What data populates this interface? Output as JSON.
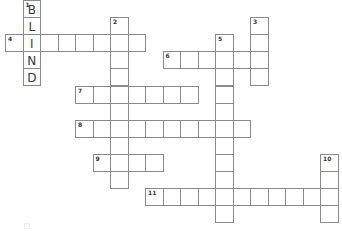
{
  "grid": {
    "cell_width": 17.5,
    "cell_height": 17.1,
    "origin_x": 5,
    "origin_y": 0,
    "colors": {
      "border": "#8a8a8a",
      "letter": "#3a3a3a",
      "number": "#333333",
      "background": "#ffffff"
    }
  },
  "entries": [
    {
      "number": "1",
      "direction": "down",
      "col": 1,
      "row": 0,
      "length": 5,
      "letters": "BLIND"
    },
    {
      "number": "2",
      "direction": "down",
      "col": 6,
      "row": 1,
      "length": 10,
      "letters": ""
    },
    {
      "number": "3",
      "direction": "down",
      "col": 14,
      "row": 1,
      "length": 4,
      "letters": ""
    },
    {
      "number": "4",
      "direction": "across",
      "col": 0,
      "row": 2,
      "length": 8,
      "letters": ""
    },
    {
      "number": "5",
      "direction": "down",
      "col": 12,
      "row": 2,
      "length": 11,
      "letters": ""
    },
    {
      "number": "6",
      "direction": "across",
      "col": 9,
      "row": 3,
      "length": 6,
      "letters": ""
    },
    {
      "number": "7",
      "direction": "across",
      "col": 4,
      "row": 5,
      "length": 7,
      "letters": ""
    },
    {
      "number": "8",
      "direction": "across",
      "col": 4,
      "row": 7,
      "length": 10,
      "letters": ""
    },
    {
      "number": "9",
      "direction": "across",
      "col": 5,
      "row": 9,
      "length": 4,
      "letters": ""
    },
    {
      "number": "10",
      "direction": "down",
      "col": 18,
      "row": 9,
      "length": 4,
      "letters": ""
    },
    {
      "number": "11",
      "direction": "across",
      "col": 8,
      "row": 11,
      "length": 11,
      "letters": ""
    }
  ]
}
